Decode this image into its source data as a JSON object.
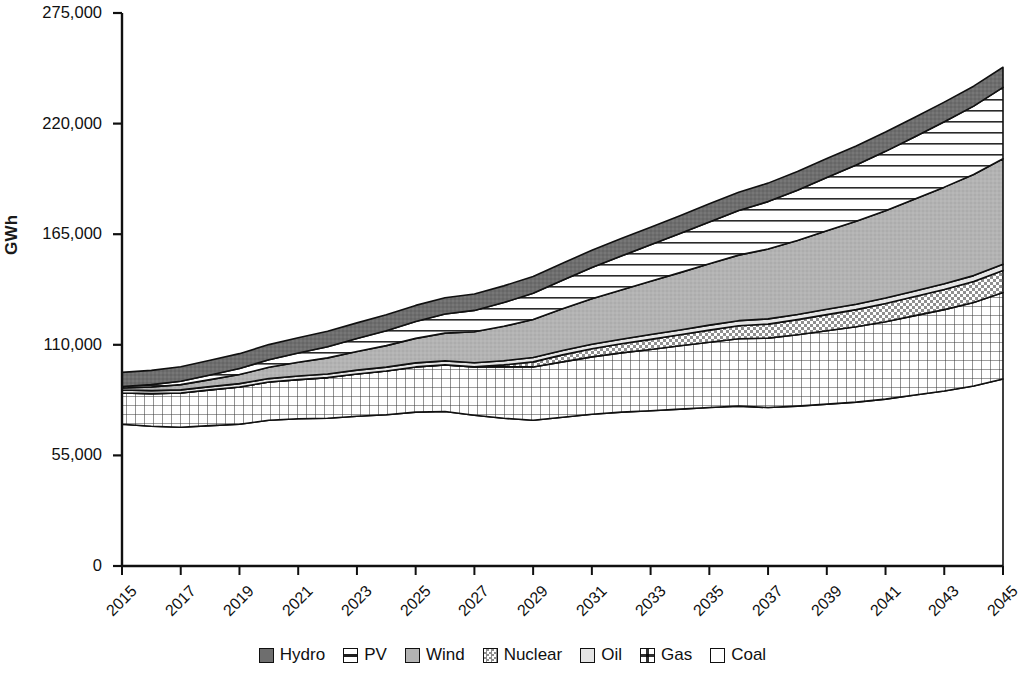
{
  "chart_data": {
    "type": "area",
    "stacked": true,
    "title": "",
    "xlabel": "",
    "ylabel": "GWh",
    "ylim": [
      0,
      275000
    ],
    "yticks": [
      "0",
      "55,000",
      "110,000",
      "165,000",
      "220,000",
      "275,000"
    ],
    "ytick_values": [
      0,
      55000,
      110000,
      165000,
      220000,
      275000
    ],
    "grid": false,
    "legend_position": "bottom",
    "x": [
      2015,
      2016,
      2017,
      2018,
      2019,
      2020,
      2021,
      2022,
      2023,
      2024,
      2025,
      2026,
      2027,
      2028,
      2029,
      2030,
      2031,
      2032,
      2033,
      2034,
      2035,
      2036,
      2037,
      2038,
      2039,
      2040,
      2041,
      2042,
      2043,
      2044,
      2045
    ],
    "xticks": [
      "2015",
      "2017",
      "2019",
      "2021",
      "2023",
      "2025",
      "2027",
      "2029",
      "2031",
      "2033",
      "2035",
      "2037",
      "2039",
      "2041",
      "2043",
      "2045"
    ],
    "stack_order_bottom_to_top": [
      "Coal",
      "Gas",
      "Nuclear",
      "Oil",
      "Wind",
      "PV",
      "Hydro"
    ],
    "series": [
      {
        "name": "Coal",
        "pattern": "solid-white",
        "color": "#ffffff",
        "values": [
          70500,
          69500,
          69000,
          69800,
          70500,
          72500,
          73200,
          73500,
          74500,
          75200,
          76500,
          76800,
          75000,
          73500,
          72500,
          74000,
          75500,
          76500,
          77200,
          78000,
          78800,
          79500,
          78800,
          79500,
          80500,
          81500,
          83000,
          85000,
          87000,
          89500,
          93000
        ]
      },
      {
        "name": "Gas",
        "pattern": "grid",
        "color": "#ffffff",
        "values": [
          15500,
          16200,
          17000,
          17800,
          18500,
          19000,
          19500,
          20200,
          21000,
          21800,
          22500,
          23200,
          24000,
          25500,
          26500,
          27500,
          28500,
          29500,
          30500,
          31500,
          32500,
          33500,
          34500,
          35500,
          36500,
          37500,
          38500,
          39500,
          40500,
          41500,
          43000
        ]
      },
      {
        "name": "Nuclear",
        "pattern": "checker",
        "color": "#d8d8d8",
        "values": [
          0,
          0,
          0,
          0,
          0,
          0,
          0,
          0,
          0,
          0,
          0,
          0,
          0,
          1000,
          2500,
          3500,
          4000,
          4500,
          5000,
          5500,
          6000,
          6500,
          7000,
          7500,
          8000,
          8500,
          9000,
          9500,
          10000,
          10500,
          11000
        ]
      },
      {
        "name": "Oil",
        "pattern": "solid-lightgray",
        "color": "#e3e3e3",
        "values": [
          1500,
          1500,
          1600,
          1600,
          1700,
          1700,
          1800,
          1800,
          1900,
          1900,
          2000,
          2000,
          2100,
          2100,
          2200,
          2200,
          2300,
          2300,
          2400,
          2400,
          2500,
          2500,
          2600,
          2600,
          2700,
          2700,
          2800,
          2800,
          2900,
          2900,
          3000
        ]
      },
      {
        "name": "Wind",
        "pattern": "solid-gray",
        "color": "#b0b0b0",
        "values": [
          1000,
          1800,
          2600,
          3500,
          4500,
          5600,
          6800,
          8000,
          9300,
          10700,
          12200,
          13800,
          15400,
          17100,
          18900,
          20700,
          22600,
          24500,
          26500,
          28500,
          30500,
          32600,
          34700,
          36800,
          39000,
          41200,
          43400,
          45700,
          48000,
          50300,
          52500
        ]
      },
      {
        "name": "PV",
        "pattern": "horizontal-lines",
        "color": "#ffffff",
        "values": [
          800,
          1200,
          1700,
          2300,
          3000,
          3800,
          4600,
          5500,
          6400,
          7400,
          8400,
          9500,
          10600,
          11800,
          13000,
          14200,
          15500,
          16800,
          18100,
          19400,
          20800,
          22200,
          23600,
          25000,
          26500,
          28000,
          29500,
          31000,
          32500,
          34000,
          35500
        ]
      },
      {
        "name": "Hydro",
        "pattern": "solid-darkgray",
        "color": "#6e6e6e",
        "values": [
          7000,
          7100,
          7200,
          7300,
          7400,
          7500,
          7600,
          7700,
          7800,
          7900,
          8000,
          8100,
          8200,
          8300,
          8400,
          8500,
          8600,
          8700,
          8800,
          8900,
          9000,
          9100,
          9200,
          9300,
          9400,
          9500,
          9600,
          9700,
          9800,
          9900,
          10000
        ]
      }
    ]
  },
  "legend": {
    "items": [
      {
        "label": "Hydro",
        "swatch": "hydro-swatch"
      },
      {
        "label": "PV",
        "swatch": "pv-swatch"
      },
      {
        "label": "Wind",
        "swatch": "wind-swatch"
      },
      {
        "label": "Nuclear",
        "swatch": "nuclear-swatch"
      },
      {
        "label": "Oil",
        "swatch": "oil-swatch"
      },
      {
        "label": "Gas",
        "swatch": "gas-swatch"
      },
      {
        "label": "Coal",
        "swatch": "coal-swatch"
      }
    ]
  },
  "colors": {
    "hydro": "#6e6e6e",
    "wind": "#b0b0b0",
    "oil": "#e3e3e3",
    "nuclear": "#d8d8d8",
    "axis": "#101010"
  }
}
